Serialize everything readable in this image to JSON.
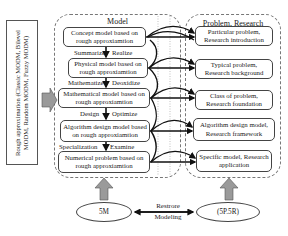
{
  "left_box": {
    "text": "Rough approximation (Classic MODM, Bilevel MODM, Random MODM, Fuzzy MODM)"
  },
  "model_panel": {
    "title": "Model",
    "nodes": [
      {
        "label": "Concept model based on rough approxiamtion"
      },
      {
        "label": "Physical model based on rough approxiamtion"
      },
      {
        "label": "Mathematical model based on rough approxiamtion"
      },
      {
        "label": "Algorithm design model based on rough approxiamtion"
      },
      {
        "label": "Numerical problem based on rough approxiamtion"
      }
    ],
    "steps": [
      {
        "left": "Summarize",
        "right": "Realize"
      },
      {
        "left": "Mathematize",
        "right": "Deoxidize"
      },
      {
        "left": "Design",
        "right": "Optimize"
      },
      {
        "left": "Specialization",
        "right": "Examine"
      }
    ]
  },
  "problem_panel": {
    "title": "Problem, Research",
    "nodes": [
      {
        "label": "Particular problem, Research introduction"
      },
      {
        "label": "Typical problem, Research background"
      },
      {
        "label": "Class of problem, Research foundation"
      },
      {
        "label": "Algorithm design model, Research framework"
      },
      {
        "label": "Specific model, Research application"
      }
    ]
  },
  "bottom": {
    "left_ellipse": "5M",
    "right_ellipse": "(5P.5R)",
    "link_top": "Restrore",
    "link_bottom": "Modeling"
  },
  "colors": {
    "gray_arrow": "#9a9a9a",
    "line": "#111111",
    "border": "#444444"
  }
}
